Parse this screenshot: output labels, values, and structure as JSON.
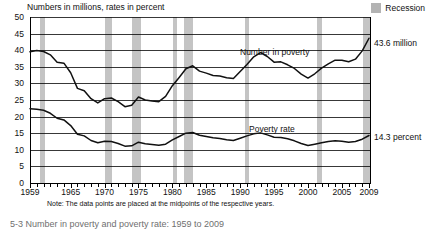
{
  "figure": {
    "axis_title": "Numbers in millions, rates in percent",
    "note": "Note: The data points are placed at the midpoints of the respective years.",
    "caption": "5-3  Number in poverty and poverty rate: 1959 to 2009",
    "legend": {
      "recession_label": "Recession",
      "recession_color": "#c4c4c4"
    },
    "series_labels": {
      "number_in_poverty": "Number in poverty",
      "poverty_rate": "Poverty rate"
    },
    "end_labels": {
      "number_in_poverty": "43.6 million",
      "poverty_rate": "14.3 percent"
    }
  },
  "chart_data": {
    "type": "line",
    "title": "Number in poverty and poverty rate: 1959 to 2009",
    "subtitle": "Numbers in millions, rates in percent",
    "xlabel": "",
    "ylabel": "Numbers in millions, rates in percent",
    "xlim": [
      1959,
      2009
    ],
    "ylim": [
      0,
      50
    ],
    "ytick_values": [
      0,
      5,
      10,
      15,
      20,
      25,
      30,
      35,
      40,
      45,
      50
    ],
    "xtick_labels": [
      "1959",
      "1965",
      "1970",
      "1975",
      "1980",
      "1985",
      "1990",
      "1995",
      "2000",
      "2005",
      "2009"
    ],
    "xtick_label_years": [
      1959,
      1965,
      1970,
      1975,
      1980,
      1985,
      1990,
      1995,
      2000,
      2005,
      2009
    ],
    "grid": "horizontal",
    "legend_position": "top-right",
    "line_color": "#111111",
    "x": [
      1959,
      1960,
      1961,
      1962,
      1963,
      1964,
      1965,
      1966,
      1967,
      1968,
      1969,
      1970,
      1971,
      1972,
      1973,
      1974,
      1975,
      1976,
      1977,
      1978,
      1979,
      1980,
      1981,
      1982,
      1983,
      1984,
      1985,
      1986,
      1987,
      1988,
      1989,
      1990,
      1991,
      1992,
      1993,
      1994,
      1995,
      1996,
      1997,
      1998,
      1999,
      2000,
      2001,
      2002,
      2003,
      2004,
      2005,
      2006,
      2007,
      2008,
      2009
    ],
    "series": [
      {
        "name": "Number in poverty",
        "unit": "millions",
        "values": [
          39.5,
          39.9,
          39.6,
          38.6,
          36.4,
          36.1,
          33.2,
          28.5,
          27.8,
          25.4,
          24.1,
          25.4,
          25.6,
          24.5,
          23.0,
          23.4,
          25.9,
          25.0,
          24.7,
          24.5,
          26.1,
          29.3,
          31.8,
          34.4,
          35.3,
          33.7,
          33.1,
          32.4,
          32.2,
          31.7,
          31.5,
          33.6,
          35.7,
          38.0,
          39.3,
          38.1,
          36.4,
          36.5,
          35.6,
          34.5,
          32.8,
          31.6,
          32.9,
          34.6,
          35.9,
          37.0,
          37.0,
          36.5,
          37.3,
          39.8,
          43.6
        ]
      },
      {
        "name": "Poverty rate",
        "unit": "percent",
        "values": [
          22.4,
          22.2,
          21.9,
          21.0,
          19.5,
          19.0,
          17.3,
          14.7,
          14.2,
          12.8,
          12.1,
          12.6,
          12.5,
          11.9,
          11.1,
          11.2,
          12.3,
          11.8,
          11.6,
          11.4,
          11.7,
          13.0,
          14.0,
          15.0,
          15.2,
          14.4,
          14.0,
          13.6,
          13.4,
          13.0,
          12.8,
          13.5,
          14.2,
          14.8,
          15.1,
          14.5,
          13.8,
          13.7,
          13.3,
          12.7,
          11.9,
          11.3,
          11.7,
          12.1,
          12.5,
          12.7,
          12.6,
          12.3,
          12.5,
          13.2,
          14.3
        ]
      }
    ],
    "annotations": [
      {
        "text": "43.6 million",
        "series": "Number in poverty",
        "year": 2009,
        "value": 43.6
      },
      {
        "text": "14.3 percent",
        "series": "Poverty rate",
        "year": 2009,
        "value": 14.3
      }
    ],
    "recession_bands": [
      {
        "start": 1960.3,
        "end": 1961.1
      },
      {
        "start": 1969.9,
        "end": 1970.9
      },
      {
        "start": 1973.9,
        "end": 1975.2
      },
      {
        "start": 1980.0,
        "end": 1980.6
      },
      {
        "start": 1981.5,
        "end": 1982.9
      },
      {
        "start": 1990.5,
        "end": 1991.2
      },
      {
        "start": 2001.2,
        "end": 2001.9
      },
      {
        "start": 2007.9,
        "end": 2009.5
      }
    ]
  }
}
